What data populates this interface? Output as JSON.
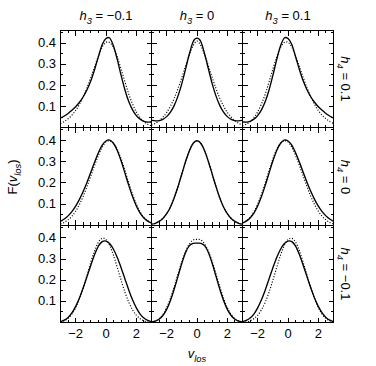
{
  "figure": {
    "type": "multi-panel-line-grid",
    "background": "#ffffff",
    "ink": "#000000",
    "panel_rows": 3,
    "panel_cols": 3
  },
  "axes": {
    "x_label_main": "v",
    "x_label_sub": "los",
    "y_label_pre": "F(",
    "y_label_main": "v",
    "y_label_sub": "los",
    "y_label_post": ")",
    "x_ticks_major": [
      -2,
      0,
      2
    ],
    "x_tick_labels": [
      "−2",
      "0",
      "2"
    ],
    "x_minor_step": 0.5,
    "xlim": [
      -3,
      3
    ],
    "y_ticks_major": [
      0.1,
      0.2,
      0.3,
      0.4
    ],
    "y_tick_labels": [
      "0.1",
      "0.2",
      "0.3",
      "0.4"
    ],
    "y_minor_step": 0.05,
    "ylim": [
      0,
      0.46
    ],
    "grid": false,
    "tick_direction": "in"
  },
  "column_headers": [
    {
      "var": "h",
      "sub": "3",
      "eq": " = ",
      "value": "−0.1",
      "full": "h3 = −0.1"
    },
    {
      "var": "h",
      "sub": "3",
      "eq": " = ",
      "value": "0",
      "full": "h3 = 0"
    },
    {
      "var": "h",
      "sub": "3",
      "eq": " = ",
      "value": "0.1",
      "full": "h3 = 0.1"
    }
  ],
  "row_headers": [
    {
      "var": "h",
      "sub": "4",
      "eq": " = ",
      "value": "0.1",
      "full": "h4 = 0.1"
    },
    {
      "var": "h",
      "sub": "4",
      "eq": " = ",
      "value": "0",
      "full": "h4 = 0"
    },
    {
      "var": "h",
      "sub": "4",
      "eq": " = ",
      "value": "−0.1",
      "full": "h4 = −0.1"
    }
  ],
  "chart_data": {
    "type": "line",
    "title": "",
    "xlabel": "v_los",
    "ylabel": "F(v_los)",
    "xlim": [
      -3,
      3
    ],
    "ylim": [
      0,
      0.46
    ],
    "grid": false,
    "legend": "none",
    "panels": [
      {
        "row": 0,
        "col": 0,
        "h3": -0.1,
        "h4": 0.1,
        "col_header": "h3 = −0.1",
        "row_header": "h4 = 0.1",
        "series": [
          {
            "name": "gauss-hermite",
            "style": "solid",
            "peak_x": 0.15,
            "peak_y": 0.425
          },
          {
            "name": "gaussian-fit",
            "style": "dotted",
            "peak_x": 0.1,
            "peak_y": 0.405,
            "sigma": 0.95
          }
        ],
        "x": [
          -3.0,
          -2.75,
          -2.5,
          -2.25,
          -2.0,
          -1.75,
          -1.5,
          -1.25,
          -1.0,
          -0.75,
          -0.5,
          -0.25,
          0.0,
          0.25,
          0.5,
          0.75,
          1.0,
          1.25,
          1.5,
          1.75,
          2.0,
          2.25,
          2.5,
          2.75,
          3.0
        ],
        "y_solid": [
          0.046,
          0.056,
          0.068,
          0.083,
          0.1,
          0.121,
          0.147,
          0.18,
          0.222,
          0.276,
          0.336,
          0.394,
          0.422,
          0.424,
          0.386,
          0.321,
          0.247,
          0.179,
          0.124,
          0.085,
          0.058,
          0.041,
          0.031,
          0.027,
          0.028
        ],
        "y_dotted": [
          0.021,
          0.03,
          0.043,
          0.06,
          0.082,
          0.111,
          0.147,
          0.19,
          0.238,
          0.289,
          0.34,
          0.382,
          0.404,
          0.403,
          0.379,
          0.334,
          0.277,
          0.217,
          0.16,
          0.113,
          0.075,
          0.048,
          0.029,
          0.017,
          0.009
        ]
      },
      {
        "row": 0,
        "col": 1,
        "h3": 0,
        "h4": 0.1,
        "col_header": "h3 = 0",
        "row_header": "h4 = 0.1",
        "series": [
          {
            "name": "gauss-hermite",
            "style": "solid",
            "peak_x": 0.0,
            "peak_y": 0.424
          },
          {
            "name": "gaussian-fit",
            "style": "dotted",
            "peak_x": 0.0,
            "peak_y": 0.41,
            "sigma": 0.93
          }
        ],
        "x": [
          -3.0,
          -2.75,
          -2.5,
          -2.25,
          -2.0,
          -1.75,
          -1.5,
          -1.25,
          -1.0,
          -0.75,
          -0.5,
          -0.25,
          0.0,
          0.25,
          0.5,
          0.75,
          1.0,
          1.25,
          1.5,
          1.75,
          2.0,
          2.25,
          2.5,
          2.75,
          3.0
        ],
        "y_solid": [
          0.036,
          0.033,
          0.034,
          0.04,
          0.053,
          0.074,
          0.106,
          0.151,
          0.209,
          0.279,
          0.35,
          0.408,
          0.424,
          0.408,
          0.35,
          0.279,
          0.209,
          0.151,
          0.106,
          0.074,
          0.053,
          0.04,
          0.034,
          0.033,
          0.036
        ],
        "y_dotted": [
          0.013,
          0.021,
          0.033,
          0.05,
          0.073,
          0.103,
          0.14,
          0.186,
          0.238,
          0.293,
          0.346,
          0.389,
          0.41,
          0.389,
          0.346,
          0.293,
          0.238,
          0.186,
          0.14,
          0.103,
          0.073,
          0.05,
          0.033,
          0.021,
          0.013
        ]
      },
      {
        "row": 0,
        "col": 2,
        "h3": 0.1,
        "h4": 0.1,
        "col_header": "h3 = 0.1",
        "row_header": "h4 = 0.1",
        "series": [
          {
            "name": "gauss-hermite",
            "style": "solid",
            "peak_x": -0.15,
            "peak_y": 0.425
          },
          {
            "name": "gaussian-fit",
            "style": "dotted",
            "peak_x": -0.1,
            "peak_y": 0.405,
            "sigma": 0.95
          }
        ],
        "x": [
          -3.0,
          -2.75,
          -2.5,
          -2.25,
          -2.0,
          -1.75,
          -1.5,
          -1.25,
          -1.0,
          -0.75,
          -0.5,
          -0.25,
          0.0,
          0.25,
          0.5,
          0.75,
          1.0,
          1.25,
          1.5,
          1.75,
          2.0,
          2.25,
          2.5,
          2.75,
          3.0
        ],
        "y_solid": [
          0.028,
          0.027,
          0.031,
          0.041,
          0.058,
          0.085,
          0.124,
          0.179,
          0.247,
          0.321,
          0.386,
          0.424,
          0.422,
          0.394,
          0.336,
          0.276,
          0.222,
          0.18,
          0.147,
          0.121,
          0.1,
          0.083,
          0.068,
          0.056,
          0.046
        ],
        "y_dotted": [
          0.009,
          0.017,
          0.029,
          0.048,
          0.075,
          0.113,
          0.16,
          0.217,
          0.277,
          0.334,
          0.379,
          0.403,
          0.404,
          0.382,
          0.34,
          0.289,
          0.238,
          0.19,
          0.147,
          0.111,
          0.082,
          0.06,
          0.043,
          0.03,
          0.021
        ]
      },
      {
        "row": 1,
        "col": 0,
        "h3": -0.1,
        "h4": 0,
        "col_header": "h3 = −0.1",
        "row_header": "h4 = 0",
        "series": [
          {
            "name": "gauss-hermite",
            "style": "solid",
            "peak_x": 0.28,
            "peak_y": 0.402
          },
          {
            "name": "gaussian-fit",
            "style": "dotted",
            "peak_x": 0.22,
            "peak_y": 0.398,
            "sigma": 1.0
          }
        ],
        "x": [
          -3.0,
          -2.75,
          -2.5,
          -2.25,
          -2.0,
          -1.75,
          -1.5,
          -1.25,
          -1.0,
          -0.75,
          -0.5,
          -0.25,
          0.0,
          0.25,
          0.5,
          0.75,
          1.0,
          1.25,
          1.5,
          1.75,
          2.0,
          2.25,
          2.5,
          2.75,
          3.0
        ],
        "y_solid": [
          0.018,
          0.029,
          0.044,
          0.064,
          0.09,
          0.122,
          0.16,
          0.203,
          0.25,
          0.298,
          0.342,
          0.378,
          0.398,
          0.402,
          0.386,
          0.352,
          0.303,
          0.246,
          0.188,
          0.135,
          0.091,
          0.057,
          0.034,
          0.019,
          0.01
        ],
        "y_dotted": [
          0.006,
          0.013,
          0.025,
          0.042,
          0.066,
          0.098,
          0.137,
          0.183,
          0.233,
          0.283,
          0.33,
          0.369,
          0.394,
          0.398,
          0.387,
          0.358,
          0.313,
          0.258,
          0.2,
          0.146,
          0.099,
          0.063,
          0.037,
          0.021,
          0.011
        ]
      },
      {
        "row": 1,
        "col": 1,
        "h3": 0,
        "h4": 0,
        "col_header": "h3 = 0",
        "row_header": "h4 = 0",
        "series": [
          {
            "name": "gauss-hermite",
            "style": "solid",
            "peak_x": 0.0,
            "peak_y": 0.399
          },
          {
            "name": "gaussian-fit",
            "style": "dotted",
            "peak_x": 0.0,
            "peak_y": 0.399,
            "sigma": 1.0,
            "note": "coincides exactly with solid curve"
          }
        ],
        "x": [
          -3.0,
          -2.75,
          -2.5,
          -2.25,
          -2.0,
          -1.75,
          -1.5,
          -1.25,
          -1.0,
          -0.75,
          -0.5,
          -0.25,
          0.0,
          0.25,
          0.5,
          0.75,
          1.0,
          1.25,
          1.5,
          1.75,
          2.0,
          2.25,
          2.5,
          2.75,
          3.0
        ],
        "y_solid": [
          0.004,
          0.009,
          0.018,
          0.032,
          0.054,
          0.086,
          0.13,
          0.183,
          0.242,
          0.301,
          0.352,
          0.387,
          0.399,
          0.387,
          0.352,
          0.301,
          0.242,
          0.183,
          0.13,
          0.086,
          0.054,
          0.032,
          0.018,
          0.009,
          0.004
        ],
        "y_dotted": [
          0.004,
          0.009,
          0.018,
          0.032,
          0.054,
          0.086,
          0.13,
          0.183,
          0.242,
          0.301,
          0.352,
          0.387,
          0.399,
          0.387,
          0.352,
          0.301,
          0.242,
          0.183,
          0.13,
          0.086,
          0.054,
          0.032,
          0.018,
          0.009,
          0.004
        ]
      },
      {
        "row": 1,
        "col": 2,
        "h3": 0.1,
        "h4": 0,
        "col_header": "h3 = 0.1",
        "row_header": "h4 = 0",
        "series": [
          {
            "name": "gauss-hermite",
            "style": "solid",
            "peak_x": -0.28,
            "peak_y": 0.402
          },
          {
            "name": "gaussian-fit",
            "style": "dotted",
            "peak_x": -0.22,
            "peak_y": 0.398,
            "sigma": 1.0
          }
        ],
        "x": [
          -3.0,
          -2.75,
          -2.5,
          -2.25,
          -2.0,
          -1.75,
          -1.5,
          -1.25,
          -1.0,
          -0.75,
          -0.5,
          -0.25,
          0.0,
          0.25,
          0.5,
          0.75,
          1.0,
          1.25,
          1.5,
          1.75,
          2.0,
          2.25,
          2.5,
          2.75,
          3.0
        ],
        "y_solid": [
          0.01,
          0.019,
          0.034,
          0.057,
          0.091,
          0.135,
          0.188,
          0.246,
          0.303,
          0.352,
          0.386,
          0.402,
          0.398,
          0.378,
          0.342,
          0.298,
          0.25,
          0.203,
          0.16,
          0.122,
          0.09,
          0.064,
          0.044,
          0.029,
          0.018
        ],
        "y_dotted": [
          0.011,
          0.021,
          0.037,
          0.063,
          0.099,
          0.146,
          0.2,
          0.258,
          0.313,
          0.358,
          0.387,
          0.398,
          0.394,
          0.369,
          0.33,
          0.283,
          0.233,
          0.183,
          0.137,
          0.098,
          0.066,
          0.042,
          0.025,
          0.013,
          0.006
        ]
      },
      {
        "row": 2,
        "col": 0,
        "h3": -0.1,
        "h4": -0.1,
        "col_header": "h3 = −0.1",
        "row_header": "h4 = −0.1",
        "series": [
          {
            "name": "gauss-hermite",
            "style": "solid",
            "peak_x": 0.35,
            "peak_y": 0.385
          },
          {
            "name": "gaussian-fit",
            "style": "dotted",
            "peak_x": 0.28,
            "peak_y": 0.398,
            "sigma": 1.0
          }
        ],
        "x": [
          -3.0,
          -2.75,
          -2.5,
          -2.25,
          -2.0,
          -1.75,
          -1.5,
          -1.25,
          -1.0,
          -0.75,
          -0.5,
          -0.25,
          0.0,
          0.25,
          0.5,
          0.75,
          1.0,
          1.25,
          1.5,
          1.75,
          2.0,
          2.25,
          2.5,
          2.75,
          3.0
        ],
        "y_solid": [
          0.004,
          0.011,
          0.024,
          0.045,
          0.076,
          0.116,
          0.164,
          0.217,
          0.271,
          0.321,
          0.361,
          0.382,
          0.385,
          0.372,
          0.345,
          0.306,
          0.258,
          0.206,
          0.154,
          0.107,
          0.069,
          0.04,
          0.021,
          0.01,
          0.004
        ],
        "y_dotted": [
          0.002,
          0.008,
          0.019,
          0.039,
          0.07,
          0.112,
          0.165,
          0.224,
          0.285,
          0.339,
          0.38,
          0.398,
          0.392,
          0.363,
          0.316,
          0.259,
          0.199,
          0.143,
          0.096,
          0.06,
          0.034,
          0.018,
          0.008,
          0.003,
          0.001
        ]
      },
      {
        "row": 2,
        "col": 1,
        "h3": 0,
        "h4": -0.1,
        "col_header": "h3 = 0",
        "row_header": "h4 = −0.1",
        "series": [
          {
            "name": "gauss-hermite",
            "style": "solid",
            "peak_x": 0.0,
            "peak_y": 0.375
          },
          {
            "name": "gaussian-fit",
            "style": "dotted",
            "peak_x": 0.0,
            "peak_y": 0.393,
            "sigma": 1.02
          }
        ],
        "x": [
          -3.0,
          -2.75,
          -2.5,
          -2.25,
          -2.0,
          -1.75,
          -1.5,
          -1.25,
          -1.0,
          -0.75,
          -0.5,
          -0.25,
          0.0,
          0.25,
          0.5,
          0.75,
          1.0,
          1.25,
          1.5,
          1.75,
          2.0,
          2.25,
          2.5,
          2.75,
          3.0
        ],
        "y_solid": [
          0.002,
          0.006,
          0.015,
          0.033,
          0.062,
          0.104,
          0.158,
          0.219,
          0.28,
          0.331,
          0.363,
          0.374,
          0.375,
          0.374,
          0.363,
          0.331,
          0.28,
          0.219,
          0.158,
          0.104,
          0.062,
          0.033,
          0.015,
          0.006,
          0.002
        ],
        "y_dotted": [
          0.002,
          0.007,
          0.018,
          0.038,
          0.07,
          0.115,
          0.17,
          0.23,
          0.288,
          0.337,
          0.372,
          0.39,
          0.393,
          0.39,
          0.372,
          0.337,
          0.288,
          0.23,
          0.17,
          0.115,
          0.07,
          0.038,
          0.018,
          0.007,
          0.002
        ]
      },
      {
        "row": 2,
        "col": 2,
        "h3": 0.1,
        "h4": -0.1,
        "col_header": "h3 = 0.1",
        "row_header": "h4 = −0.1",
        "series": [
          {
            "name": "gauss-hermite",
            "style": "solid",
            "peak_x": -0.35,
            "peak_y": 0.385
          },
          {
            "name": "gaussian-fit",
            "style": "dotted",
            "peak_x": -0.28,
            "peak_y": 0.398,
            "sigma": 1.0
          }
        ],
        "x": [
          -3.0,
          -2.75,
          -2.5,
          -2.25,
          -2.0,
          -1.75,
          -1.5,
          -1.25,
          -1.0,
          -0.75,
          -0.5,
          -0.25,
          0.0,
          0.25,
          0.5,
          0.75,
          1.0,
          1.25,
          1.5,
          1.75,
          2.0,
          2.25,
          2.5,
          2.75,
          3.0
        ],
        "y_solid": [
          0.004,
          0.01,
          0.021,
          0.04,
          0.069,
          0.107,
          0.154,
          0.206,
          0.258,
          0.306,
          0.345,
          0.372,
          0.385,
          0.382,
          0.361,
          0.321,
          0.271,
          0.217,
          0.164,
          0.116,
          0.076,
          0.045,
          0.024,
          0.011,
          0.004
        ],
        "y_dotted": [
          0.001,
          0.003,
          0.008,
          0.018,
          0.034,
          0.06,
          0.096,
          0.143,
          0.199,
          0.259,
          0.316,
          0.363,
          0.392,
          0.398,
          0.38,
          0.339,
          0.285,
          0.224,
          0.165,
          0.112,
          0.07,
          0.039,
          0.019,
          0.008,
          0.002
        ]
      }
    ]
  }
}
